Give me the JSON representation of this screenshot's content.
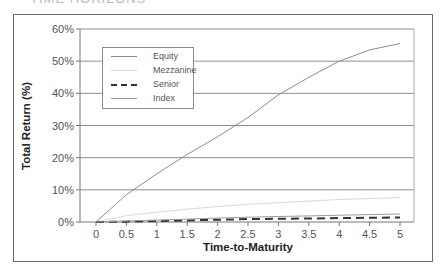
{
  "page": {
    "cut_title": "TIME HORIZONS"
  },
  "chart_data": {
    "type": "line",
    "title": "",
    "xlabel": "Time-to-Maturity",
    "ylabel": "Total Return (%)",
    "x": [
      0,
      0.5,
      1,
      1.5,
      2,
      2.5,
      3,
      3.5,
      4,
      4.5,
      5
    ],
    "x_tick_labels": [
      "0",
      "0.5",
      "1",
      "1.5",
      "2",
      "2.5",
      "3",
      "3.5",
      "4",
      "4.5",
      "5"
    ],
    "y_tick_labels": [
      "0%",
      "10%",
      "20%",
      "30%",
      "40%",
      "50%",
      "60%"
    ],
    "ylim": [
      0,
      60
    ],
    "xlim": [
      0,
      5
    ],
    "grid": {
      "horizontal": true,
      "vertical": false
    },
    "legend_position": "upper-left",
    "series": [
      {
        "name": "Equity",
        "color": "#8c8c8c",
        "style": "solid",
        "values": [
          0,
          8.5,
          15,
          21,
          26.5,
          32.5,
          39.5,
          45,
          50,
          53.5,
          55.5
        ]
      },
      {
        "name": "Mezzanine",
        "color": "#d9d9d9",
        "style": "solid",
        "values": [
          0,
          2,
          3,
          4,
          4.8,
          5.5,
          6,
          6.5,
          7,
          7.3,
          7.6
        ]
      },
      {
        "name": "Senior",
        "color": "#333333",
        "style": "dashed",
        "values": [
          0,
          0.1,
          0.3,
          0.5,
          0.7,
          0.9,
          1.0,
          1.1,
          1.2,
          1.3,
          1.4
        ]
      },
      {
        "name": "Index",
        "color": "#9a9a9a",
        "style": "solid",
        "values": [
          0,
          0.3,
          0.6,
          0.9,
          1.2,
          1.5,
          1.7,
          1.9,
          2.1,
          2.3,
          2.5
        ]
      }
    ]
  }
}
